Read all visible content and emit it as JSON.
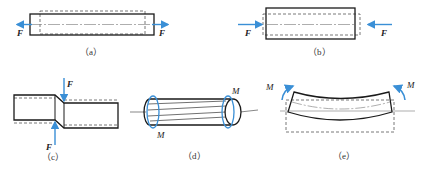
{
  "figure": {
    "colors": {
      "outline": "#1a1a1a",
      "dashed": "#555555",
      "arrow": "#3a8fd6"
    },
    "panels": [
      {
        "id": "a",
        "caption": "（a）",
        "type": "tension",
        "force_left": "F",
        "force_right": "F"
      },
      {
        "id": "b",
        "caption": "（b）",
        "type": "compression",
        "force_left": "F",
        "force_right": "F"
      },
      {
        "id": "c",
        "caption": "（c）",
        "type": "shear",
        "force_top": "F",
        "force_bottom": "F"
      },
      {
        "id": "d",
        "caption": "（d）",
        "type": "torsion",
        "moment_left": "M",
        "moment_right": "M"
      },
      {
        "id": "e",
        "caption": "（e）",
        "type": "bending",
        "moment_left": "M",
        "moment_right": "M"
      }
    ]
  }
}
